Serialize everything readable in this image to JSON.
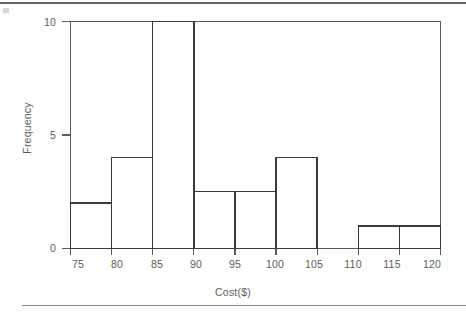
{
  "figure": {
    "yaxis_title": "Frequency",
    "xaxis_title": "Cost($)"
  },
  "ticks": {
    "x": [
      "75",
      "80",
      "85",
      "90",
      "95",
      "100",
      "105",
      "110",
      "115",
      "120"
    ],
    "y": [
      "0",
      "5",
      "10"
    ]
  },
  "colors": {
    "axis": "#5a5a5a",
    "bar_outline": "#3a3a3a",
    "bar_fill": "#ffffff",
    "text": "#5c5c5c",
    "page_rule": "#4a4a4a"
  },
  "chart_data": {
    "type": "bar",
    "title": "",
    "subtitle": "",
    "xlabel": "Cost($)",
    "ylabel": "Frequency",
    "xlim": [
      75,
      120
    ],
    "ylim": [
      0,
      10
    ],
    "grid": false,
    "legend": "none",
    "bin_width": 5,
    "bin_edges": [
      75,
      80,
      85,
      90,
      95,
      100,
      105,
      110,
      115,
      120
    ],
    "categories": [
      "75-80",
      "80-85",
      "85-90",
      "90-95",
      "95-100",
      "100-105",
      "105-110",
      "110-115",
      "115-120"
    ],
    "values": [
      2,
      4,
      10,
      2.5,
      2.5,
      4,
      0,
      1,
      1
    ],
    "xtick_values": [
      75,
      80,
      85,
      90,
      95,
      100,
      105,
      110,
      115,
      120
    ],
    "ytick_values": [
      0,
      5,
      10
    ],
    "annotations": []
  }
}
